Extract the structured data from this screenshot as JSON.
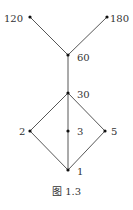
{
  "diagram": {
    "type": "hasse-diagram",
    "nodes": [
      {
        "id": "120",
        "label": "120",
        "x": 30,
        "y": 17
      },
      {
        "id": "180",
        "label": "180",
        "x": 107,
        "y": 17
      },
      {
        "id": "60",
        "label": "60",
        "x": 68,
        "y": 55
      },
      {
        "id": "30",
        "label": "30",
        "x": 68,
        "y": 93
      },
      {
        "id": "2",
        "label": "2",
        "x": 30,
        "y": 131
      },
      {
        "id": "3",
        "label": "3",
        "x": 68,
        "y": 131
      },
      {
        "id": "5",
        "label": "5",
        "x": 105,
        "y": 131
      },
      {
        "id": "1",
        "label": "1",
        "x": 68,
        "y": 170
      }
    ],
    "edges": [
      [
        "120",
        "60"
      ],
      [
        "180",
        "60"
      ],
      [
        "60",
        "30"
      ],
      [
        "30",
        "2"
      ],
      [
        "30",
        "3"
      ],
      [
        "30",
        "5"
      ],
      [
        "2",
        "1"
      ],
      [
        "3",
        "1"
      ],
      [
        "5",
        "1"
      ]
    ],
    "caption": "图 1.3"
  },
  "colors": {
    "line": "#333333",
    "node": "#111111"
  }
}
